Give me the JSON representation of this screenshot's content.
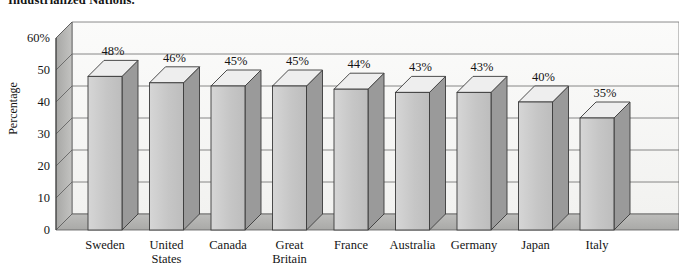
{
  "title": "Industrialized Nations.",
  "chart_data": {
    "type": "bar",
    "title": "Industrialized Nations.",
    "xlabel": "",
    "ylabel": "Percentage",
    "ylim": [
      0,
      60
    ],
    "yticks": [
      "0",
      "10",
      "20",
      "30",
      "40",
      "50",
      "60%"
    ],
    "ytick_values": [
      0,
      10,
      20,
      30,
      40,
      50,
      60
    ],
    "grid": true,
    "legend": "none",
    "style": "3d-column",
    "categories": [
      "Sweden",
      "United\nStates",
      "Canada",
      "Great\nBritain",
      "France",
      "Australia",
      "Germany",
      "Japan",
      "Italy"
    ],
    "values": [
      48,
      46,
      45,
      45,
      44,
      43,
      43,
      40,
      35
    ],
    "data_labels": [
      "48%",
      "46%",
      "45%",
      "45%",
      "44%",
      "43%",
      "43%",
      "40%",
      "35%"
    ]
  },
  "colors": {
    "bar_front": "#c9c9c9",
    "bar_side": "#9a9a9a",
    "bar_top": "#eeeeee",
    "wall_back": "#f7f7f5",
    "wall_left": "#b0b0ae",
    "floor": "#b6b6b4",
    "gridline": "#5a5a5a",
    "outline": "#3a3a3a",
    "shadow": "#cfcfcd",
    "text": "#141414",
    "background": "#ffffff"
  }
}
